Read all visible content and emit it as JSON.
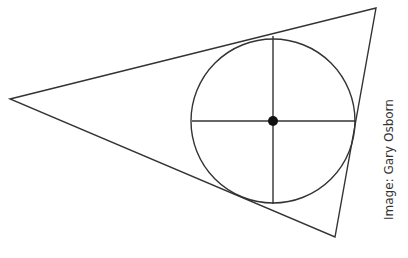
{
  "diagram": {
    "triangle": {
      "vertices": [
        [
          10,
          99
        ],
        [
          376,
          8
        ],
        [
          335,
          237
        ]
      ],
      "stroke": "#333333"
    },
    "incircle": {
      "center": [
        273,
        121
      ],
      "radius": 82,
      "stroke": "#333333"
    },
    "radii": [
      {
        "from": [
          273,
          121
        ],
        "to": [
          273,
          36
        ]
      },
      {
        "from": [
          273,
          121
        ],
        "to": [
          273,
          204
        ]
      },
      {
        "from": [
          273,
          121
        ],
        "to": [
          192,
          121
        ]
      },
      {
        "from": [
          273,
          121
        ],
        "to": [
          356,
          121
        ]
      }
    ],
    "center_dot": {
      "color": "#111111",
      "radius": 5
    }
  },
  "credit": {
    "text": "Image: Gary Osborn"
  }
}
